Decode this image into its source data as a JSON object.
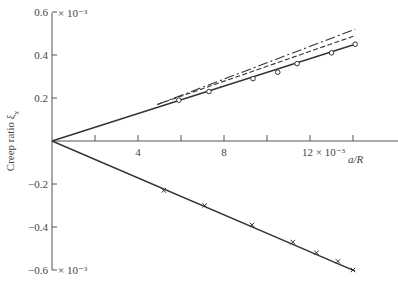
{
  "chart_data": {
    "type": "line",
    "title": "",
    "xlabel": "a/R",
    "ylabel": "Creep ratio ξ_x",
    "ylabel_main": "Creep ratio ξ",
    "ylabel_sub": "x",
    "xlim": [
      0,
      15.5
    ],
    "ylim": [
      -0.6,
      0.6
    ],
    "x_scale_note": "× 10⁻³",
    "y_scale_note": "× 10⁻³",
    "x_ticks": [
      2,
      4,
      6,
      8,
      10,
      12,
      14
    ],
    "x_tick_labels": [
      "",
      "4",
      "",
      "8",
      "",
      "12 × 10⁻³",
      ""
    ],
    "y_ticks": [
      0.6,
      0.4,
      0.2,
      -0.2,
      -0.4,
      -0.6
    ],
    "y_tick_labels": [
      "0.6",
      "0.4",
      "0.2",
      "−0.2",
      "−0.4",
      "−0.6"
    ],
    "y_top_multiplier": "× 10⁻³",
    "y_bottom_multiplier": "× 10⁻³",
    "grid": false,
    "legend": null,
    "series": [
      {
        "name": "measured longitudinal creep (circles)",
        "style": "solid",
        "marker": "circle",
        "line": [
          [
            0,
            0
          ],
          [
            14.1,
            0.45
          ]
        ],
        "points": [
          [
            5.9,
            0.19
          ],
          [
            7.3,
            0.23
          ],
          [
            9.35,
            0.29
          ],
          [
            10.5,
            0.32
          ],
          [
            11.4,
            0.36
          ],
          [
            13.0,
            0.41
          ],
          [
            14.1,
            0.45
          ]
        ]
      },
      {
        "name": "theory (dash-dot)",
        "style": "dashdot",
        "marker": "none",
        "line": [
          [
            4.9,
            0.17
          ],
          [
            14.1,
            0.52
          ]
        ]
      },
      {
        "name": "theory (dashed)",
        "style": "dashed",
        "marker": "none",
        "line": [
          [
            4.9,
            0.17
          ],
          [
            14.1,
            0.49
          ]
        ]
      },
      {
        "name": "measured negative creep (crosses)",
        "style": "solid",
        "marker": "x",
        "line": [
          [
            0,
            0
          ],
          [
            14.1,
            -0.605
          ]
        ],
        "points": [
          [
            5.2,
            -0.23
          ],
          [
            7.1,
            -0.3
          ],
          [
            9.3,
            -0.39
          ],
          [
            11.2,
            -0.47
          ],
          [
            12.3,
            -0.52
          ],
          [
            13.3,
            -0.56
          ],
          [
            14.0,
            -0.6
          ]
        ]
      }
    ]
  }
}
